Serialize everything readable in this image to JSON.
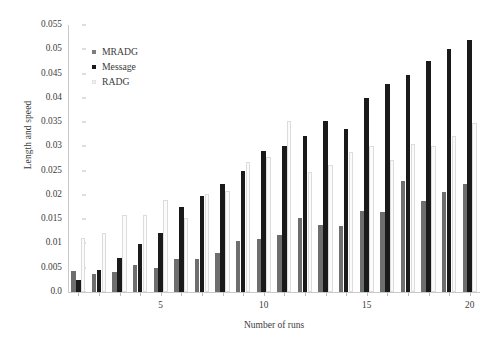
{
  "chart_data": {
    "type": "bar",
    "title": "",
    "xlabel": "Number of runs",
    "ylabel": "Length and speed",
    "grid": false,
    "legend_position": "upper-left-inside",
    "categories": [
      1,
      2,
      3,
      4,
      5,
      6,
      7,
      8,
      9,
      10,
      11,
      12,
      13,
      14,
      15,
      16,
      17,
      18,
      19,
      20
    ],
    "x_tick_labels": [
      "5",
      "10",
      "15",
      "20"
    ],
    "x_tick_values": [
      5,
      10,
      15,
      20
    ],
    "y_tick_labels": [
      "0.0",
      "0.005",
      "0.01",
      "0.015",
      "0.02",
      "0.025",
      "0.03",
      "0.035",
      "0.04",
      "0.045",
      "0.05",
      "0.055"
    ],
    "y_tick_values": [
      0,
      0.005,
      0.01,
      0.015,
      0.02,
      0.025,
      0.03,
      0.035,
      0.04,
      0.045,
      0.05,
      0.055
    ],
    "ylim": [
      0,
      0.055
    ],
    "series": [
      {
        "name": "MRADG",
        "color": "#6e6e6e",
        "values": [
          0.0043,
          0.0038,
          0.0042,
          0.0055,
          0.005,
          0.0068,
          0.0068,
          0.008,
          0.0105,
          0.011,
          0.0118,
          0.0152,
          0.0138,
          0.0135,
          0.0166,
          0.0165,
          0.0228,
          0.0188,
          0.0205,
          0.0222
        ]
      },
      {
        "name": "Message",
        "color": "#1a1a1a",
        "values": [
          0.0024,
          0.0046,
          0.0071,
          0.0098,
          0.0122,
          0.0175,
          0.0198,
          0.0223,
          0.025,
          0.029,
          0.03,
          0.0322,
          0.0352,
          0.0335,
          0.04,
          0.0428,
          0.0448,
          0.0475,
          0.05,
          0.052
        ]
      },
      {
        "name": "RADG",
        "color": "#fbfbfb",
        "values": [
          0.0112,
          0.0122,
          0.0158,
          0.0158,
          0.019,
          0.0152,
          0.0202,
          0.0208,
          0.0268,
          0.0278,
          0.0352,
          0.0248,
          0.0262,
          0.0288,
          0.03,
          0.0272,
          0.0305,
          0.03,
          0.0322,
          0.0348
        ]
      }
    ]
  },
  "legend": {
    "items": [
      {
        "label": "MRADG",
        "swatch": "mradg"
      },
      {
        "label": "Message",
        "swatch": "message"
      },
      {
        "label": "RADG",
        "swatch": "radg"
      }
    ]
  },
  "axes": {
    "x_title": "Number of runs",
    "y_title": "Length and speed"
  }
}
